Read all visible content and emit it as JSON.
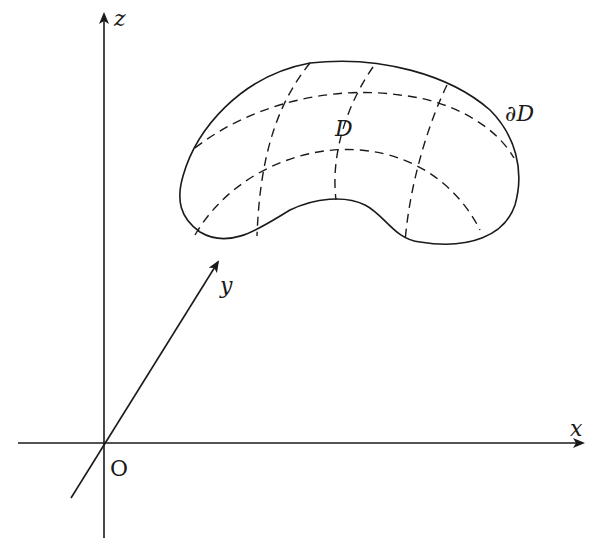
{
  "diagram": {
    "axes": {
      "x_label": "x",
      "y_label": "y",
      "z_label": "z",
      "origin_label": "O"
    },
    "surface": {
      "label": "D",
      "boundary_label": "∂D"
    },
    "colors": {
      "stroke": "#1a1a1a",
      "background": "#ffffff"
    }
  }
}
